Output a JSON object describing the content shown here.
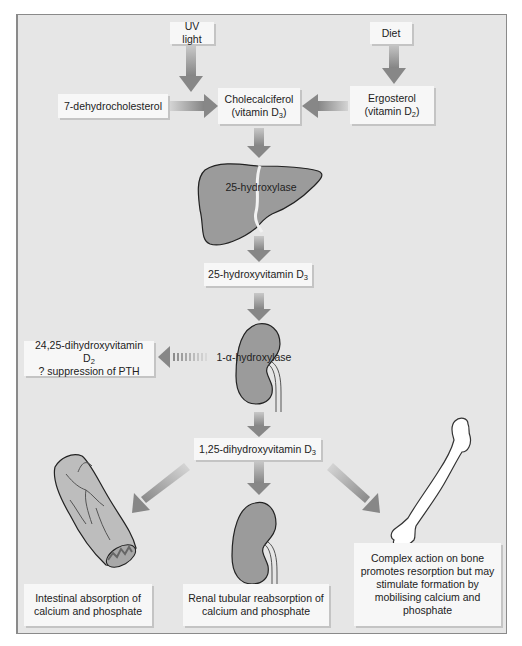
{
  "diagram": {
    "colors": {
      "panel_bg": "#e6e6e6",
      "box_bg": "#f7f7f7",
      "organ_fill": "#9b9b9b",
      "arrow": "#8c8c8c"
    },
    "sources": {
      "uv_light": "UV light",
      "diet": "Diet",
      "precursor": "7-dehydrocholesterol",
      "cholecalciferol": {
        "line1": "Cholecalciferol",
        "line2_prefix": "(vitamin D",
        "line2_sub": "3",
        "line2_suffix": ")"
      },
      "ergosterol": {
        "line1": "Ergosterol",
        "line2_prefix": "(vitamin D",
        "line2_sub": "2",
        "line2_suffix": ")"
      }
    },
    "liver": {
      "enzyme": "25-hydroxylase"
    },
    "intermediate": {
      "prefix": "25-hydroxyvitamin D",
      "sub": "3"
    },
    "kidney": {
      "enzyme": "1-α-hydroxylase"
    },
    "side_pathway": {
      "line1_prefix": "24,25-dihydroxyvitamin D",
      "line1_sub": "2",
      "line2": "? suppression of PTH"
    },
    "active": {
      "prefix": "1,25-dihydroxyvitamin D",
      "sub": "3"
    },
    "effects": [
      {
        "organ": "intestine",
        "line1": "Intestinal absorption of",
        "line2": "calcium and phosphate"
      },
      {
        "organ": "kidney",
        "line1": "Renal tubular reabsorption of",
        "line2": "calcium and phosphate"
      },
      {
        "organ": "bone",
        "lines": [
          "Complex action on bone",
          "promotes resorption but may",
          "stimulate formation by",
          "mobilising calcium and",
          "phosphate"
        ]
      }
    ]
  }
}
